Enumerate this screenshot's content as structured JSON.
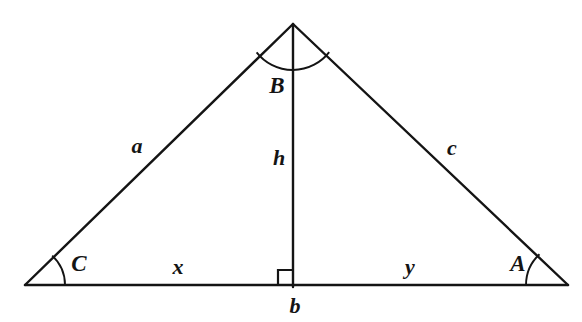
{
  "figure": {
    "kind": "geometry-diagram",
    "background_color": "#ffffff",
    "stroke_color": "#141414",
    "width": 582,
    "height": 322
  },
  "geometry": {
    "vertices": {
      "apex": {
        "name": "B",
        "x": 293,
        "y": 24
      },
      "left": {
        "name": "C",
        "x": 25,
        "y": 285
      },
      "right": {
        "name": "A",
        "x": 568,
        "y": 285
      },
      "foot": {
        "name": "H",
        "x": 293,
        "y": 285
      }
    },
    "segments": [
      {
        "id": "side-a",
        "label": "a",
        "from": "C",
        "to": "B"
      },
      {
        "id": "side-c",
        "label": "c",
        "from": "B",
        "to": "A"
      },
      {
        "id": "side-b",
        "label": "b",
        "from": "C",
        "to": "A"
      },
      {
        "id": "altitude-h",
        "label": "h",
        "from": "B",
        "to": "H"
      },
      {
        "id": "segment-x",
        "label": "x",
        "from": "C",
        "to": "H"
      },
      {
        "id": "segment-y",
        "label": "y",
        "from": "H",
        "to": "A"
      }
    ],
    "angle_marks": [
      {
        "id": "angle-B",
        "label": "B",
        "vertex": "apex",
        "radius": 46
      },
      {
        "id": "angle-C",
        "label": "C",
        "vertex": "left",
        "radius": 40
      },
      {
        "id": "angle-A",
        "label": "A",
        "vertex": "right",
        "radius": 42
      },
      {
        "id": "right-angle-foot",
        "label": "",
        "vertex": "foot",
        "size": 15
      }
    ]
  },
  "labels": {
    "side_a": {
      "text": "a",
      "x": 137,
      "y": 146
    },
    "side_c": {
      "text": "c",
      "x": 452,
      "y": 148
    },
    "side_b": {
      "text": "b",
      "x": 295,
      "y": 306
    },
    "altitude_h": {
      "text": "h",
      "x": 279,
      "y": 158
    },
    "segment_x": {
      "text": "x",
      "x": 178,
      "y": 267
    },
    "segment_y": {
      "text": "y",
      "x": 410,
      "y": 267
    },
    "vertex_A": {
      "text": "A",
      "x": 518,
      "y": 263
    },
    "vertex_B": {
      "text": "B",
      "x": 277,
      "y": 85
    },
    "vertex_C": {
      "text": "C",
      "x": 79,
      "y": 263
    }
  }
}
